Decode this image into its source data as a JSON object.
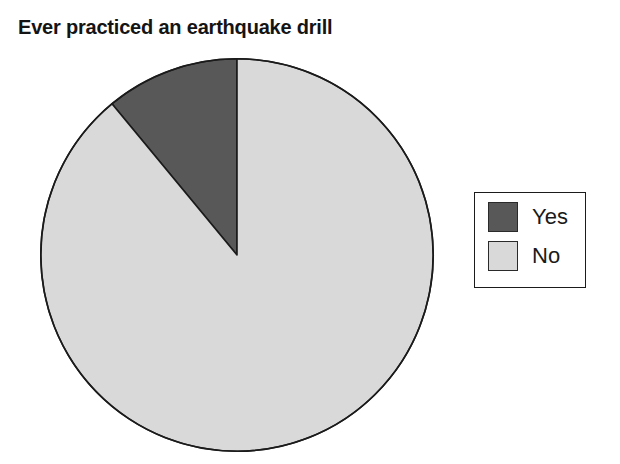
{
  "chart_data": {
    "type": "pie",
    "title": "Ever practiced an earthquake drill",
    "categories": [
      "Yes",
      "No"
    ],
    "values": [
      11,
      89
    ],
    "unit": "percent",
    "start_angle_deg": 90,
    "direction": "counterclockwise",
    "legend_position": "right",
    "legend_border": true,
    "slice_border_color": "#1b1b1b",
    "colors": [
      "#585858",
      "#d9d9d9"
    ],
    "slices": [
      {
        "label": "Yes",
        "value": 11,
        "color": "#585858",
        "sweep_deg": 39.6
      },
      {
        "label": "No",
        "value": 89,
        "color": "#d9d9d9",
        "sweep_deg": 320.4
      }
    ],
    "xlabel": "",
    "ylabel": "",
    "grid": false
  },
  "legend": {
    "items": [
      {
        "label": "Yes",
        "swatch_color": "#585858"
      },
      {
        "label": "No",
        "swatch_color": "#d9d9d9"
      }
    ]
  }
}
